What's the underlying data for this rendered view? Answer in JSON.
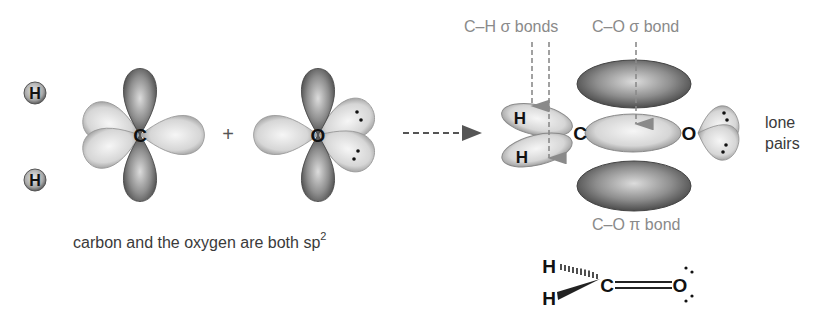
{
  "left": {
    "hydrogens": [
      {
        "symbol": "H",
        "cx": 35,
        "cy": 93
      },
      {
        "symbol": "H",
        "cx": 35,
        "cy": 180
      }
    ],
    "carbon": {
      "symbol": "C",
      "cx": 140,
      "cy": 135
    },
    "plus": "+",
    "oxygen": {
      "symbol": "O",
      "cx": 318,
      "cy": 135
    },
    "caption": "carbon and the oxygen are both sp",
    "caption_superscript": "2"
  },
  "arrow": {
    "from_x": 403,
    "to_x": 482,
    "y": 133,
    "style": "dashed"
  },
  "right": {
    "labels": {
      "ch_sigma": "C–H σ bonds",
      "co_sigma": "C–O σ bond",
      "co_pi": "C–O π bond",
      "lone_pairs_line1": "lone",
      "lone_pairs_line2": "pairs"
    },
    "atoms": {
      "h_top": "H",
      "h_bottom": "H",
      "carbon": "C",
      "oxygen": "O"
    }
  },
  "structure": {
    "h_top": "H",
    "h_bottom": "H",
    "carbon": "C",
    "oxygen": "O",
    "bond": "double"
  },
  "colors": {
    "lobe_light": "#e6e6e6",
    "lobe_dark": "#6a6a6a",
    "label_gray": "#8a8a8a",
    "text_dark": "#3a3a3a"
  }
}
